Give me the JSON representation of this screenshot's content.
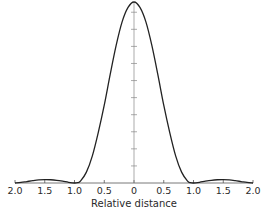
{
  "chart_data": {
    "type": "line",
    "title": "",
    "xlabel": "Relative distance",
    "ylabel": "",
    "x_tick_labels": [
      "2.0",
      "1.5",
      "1.0",
      "0.5",
      "0",
      "0.5",
      "1.0",
      "1.5",
      "2.0"
    ],
    "x_tick_values": [
      -2.0,
      -1.5,
      -1.0,
      -0.5,
      0,
      0.5,
      1.0,
      1.5,
      2.0
    ],
    "xlim": [
      -2.0,
      2.0
    ],
    "ylim": [
      0,
      1.0
    ],
    "y_ticks_count": 10,
    "grid": false,
    "legend": null,
    "series": [
      {
        "name": "intensity",
        "x": [
          -2.0,
          -1.9,
          -1.8,
          -1.7,
          -1.6,
          -1.5,
          -1.4,
          -1.3,
          -1.2,
          -1.1,
          -1.0,
          -0.95,
          -0.9,
          -0.8,
          -0.7,
          -0.6,
          -0.5,
          -0.4,
          -0.3,
          -0.2,
          -0.1,
          0,
          0.1,
          0.2,
          0.3,
          0.4,
          0.5,
          0.6,
          0.7,
          0.8,
          0.9,
          0.95,
          1.0,
          1.1,
          1.2,
          1.3,
          1.4,
          1.5,
          1.6,
          1.7,
          1.8,
          1.9,
          2.0
        ],
        "values": [
          0.0,
          0.003,
          0.008,
          0.013,
          0.017,
          0.019,
          0.018,
          0.015,
          0.01,
          0.004,
          0.0,
          0.002,
          0.01,
          0.06,
          0.15,
          0.28,
          0.43,
          0.6,
          0.76,
          0.89,
          0.97,
          1.0,
          0.97,
          0.89,
          0.76,
          0.6,
          0.43,
          0.28,
          0.15,
          0.06,
          0.01,
          0.002,
          0.0,
          0.004,
          0.01,
          0.015,
          0.018,
          0.019,
          0.017,
          0.013,
          0.008,
          0.003,
          0.0
        ]
      }
    ]
  }
}
